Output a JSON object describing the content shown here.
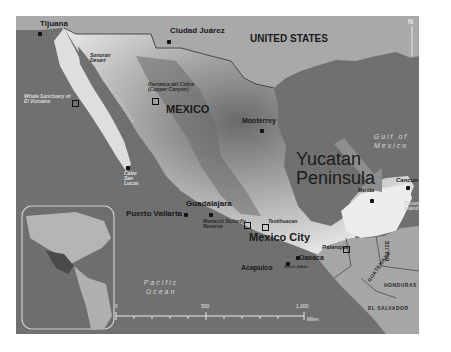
{
  "map": {
    "countries": {
      "united_states": "UNITED STATES",
      "mexico": "MEXICO",
      "guatemala": "GUATEMALA",
      "belize": "BELIZE",
      "honduras": "HONDURAS",
      "el_salvador": "EL SALVADOR"
    },
    "cities": {
      "tijuana": "Tijuana",
      "ciudad_juarez": "Ciudad Juárez",
      "monterrey": "Monterrey",
      "guadalajara": "Guadalajara",
      "puerto_vallarta": "Puerto Vallarta",
      "mexico_city": "Mexico City",
      "acapulco": "Acapulco",
      "oaxaca": "Oaxaca",
      "merida": "Merida",
      "cancun": "Cancun",
      "palenque": "Palenque",
      "cabo_san_lucas": "Cabo San Lucas"
    },
    "features": {
      "sonoran_desert": "Sonoran Desert",
      "barranca_del_cobre": "Barranca del Cobre (Copper Canyon)",
      "el_vizcaino": "Whale Sanctuary of El Vizcaíno",
      "gulf_of_california": "Gulf of California",
      "monarch_butterfly": "Monarch Butterfly Reserve",
      "teotihuacan": "Teotihuacan",
      "monte_alban": "Monte Albán",
      "cozumel": "Cozumel Island"
    },
    "water": {
      "gulf_of_mexico": "Gulf of Mexico",
      "pacific_ocean": "Pacific Ocean"
    },
    "callout": {
      "line1": "Yucatan",
      "line2": "Peninsula"
    },
    "scale": {
      "start": "0",
      "mid": "500",
      "end": "1,000",
      "unit": "Miles"
    },
    "north": "N",
    "colors": {
      "water": "#707070",
      "land_other": "#a6a6a6",
      "mexico_light": "#e6e6e6",
      "mexico_dark": "#5a5a5a",
      "arrow": "#8e8e8e",
      "border": "#4a4a4a"
    }
  }
}
